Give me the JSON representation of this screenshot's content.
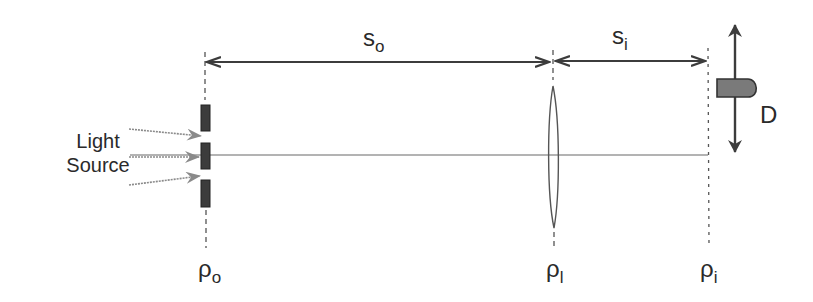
{
  "diagram": {
    "labels": {
      "light_source": [
        "Light",
        "Source"
      ],
      "s_o": {
        "main": "s",
        "sub": "o"
      },
      "s_i": {
        "main": "s",
        "sub": "i"
      },
      "detector": "D",
      "rho_o": {
        "main": "ρ",
        "sub": "o"
      },
      "rho_l": {
        "main": "ρ",
        "sub": "l"
      },
      "rho_i": {
        "main": "ρ",
        "sub": "i"
      }
    },
    "colors": {
      "line": "#3c3c3c",
      "light_ray": "#8a8a8a",
      "axis": "#9a9a9a",
      "detector_fill": "#7a7a7a"
    }
  }
}
